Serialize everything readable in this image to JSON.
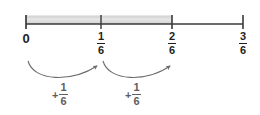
{
  "figure": {
    "type": "number-line",
    "title": ""
  },
  "colors": {
    "line": "#3a3a3a",
    "shading": "#d9d9d9",
    "label": "#231f20",
    "jump": "#6e6e6e",
    "background": "#ffffff"
  },
  "number_line": {
    "start_value": 0,
    "end_value": 0.5,
    "denominator": 6,
    "shaded_from": "0",
    "shaded_to": "2/6",
    "ticks": [
      {
        "id": "tick-0",
        "x": 26,
        "label_type": "whole",
        "label": "0",
        "numerator": "",
        "denominator": ""
      },
      {
        "id": "tick-1-6",
        "x": 101,
        "label_type": "fraction",
        "label": "1/6",
        "numerator": "1",
        "denominator": "6"
      },
      {
        "id": "tick-2-6",
        "x": 172,
        "label_type": "fraction",
        "label": "2/6",
        "numerator": "2",
        "denominator": "6"
      },
      {
        "id": "tick-3-6",
        "x": 243,
        "label_type": "fraction",
        "label": "3/6",
        "numerator": "3",
        "denominator": "6"
      }
    ]
  },
  "jumps": [
    {
      "id": "jump-1",
      "from": "0",
      "to": "1/6",
      "plus": "+",
      "numerator": "1",
      "denominator": "6",
      "label": "+1/6"
    },
    {
      "id": "jump-2",
      "from": "1/6",
      "to": "2/6",
      "plus": "+",
      "numerator": "1",
      "denominator": "6",
      "label": "+1/6"
    }
  ]
}
